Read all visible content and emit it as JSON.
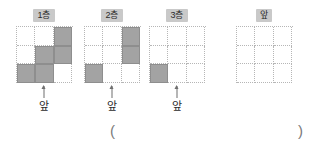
{
  "figure": {
    "kind": "floor-plan-cube-layers",
    "front_arrow_icon": "up-arrow-icon",
    "layers": [
      {
        "label": "1층",
        "front_label": "앞",
        "has_arrow": true,
        "cells": [
          [
            0,
            0,
            1
          ],
          [
            0,
            1,
            1
          ],
          [
            1,
            1,
            0
          ]
        ]
      },
      {
        "label": "2층",
        "front_label": "앞",
        "has_arrow": true,
        "cells": [
          [
            0,
            0,
            1
          ],
          [
            0,
            0,
            1
          ],
          [
            1,
            0,
            0
          ]
        ]
      },
      {
        "label": "3층",
        "front_label": "앞",
        "has_arrow": true,
        "cells": [
          [
            0,
            0,
            0
          ],
          [
            0,
            0,
            0
          ],
          [
            1,
            0,
            0
          ]
        ]
      },
      {
        "label": "앞",
        "front_label": "",
        "has_arrow": false,
        "cells": [
          [
            0,
            0,
            0
          ],
          [
            0,
            0,
            0
          ],
          [
            0,
            0,
            0
          ]
        ]
      }
    ],
    "answer": {
      "open_paren": "(",
      "close_paren": ")",
      "value": ""
    },
    "colors": {
      "filled_cell": "#a3a3a3",
      "cell_border": "#8e8e8e",
      "grid_line": "#b6b6b6",
      "label_background": "#c9c9c9",
      "text": "#2b2b2b",
      "arrow": "#6f6f6f",
      "paren": "#7a7a7a"
    }
  }
}
